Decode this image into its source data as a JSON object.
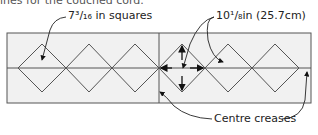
{
  "caption": "ines for the couched cord.",
  "labels": {
    "square_size": "7³/₁₆ in squares",
    "diagonal": "10¹/₈in (25.7cm)",
    "creases": "Centre creases"
  },
  "colors": {
    "background": "#ffffff",
    "panel": "#f1f1f1",
    "stroke": "#555555",
    "arrow": "#111111"
  }
}
